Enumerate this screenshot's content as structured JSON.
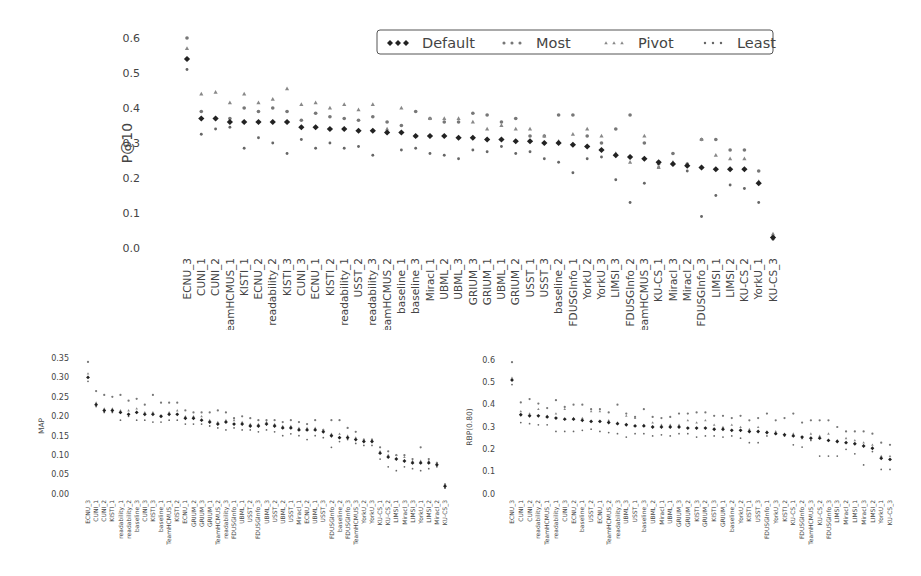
{
  "chart_data": [
    {
      "type": "scatter",
      "title": "",
      "xlabel": "",
      "ylabel": "P@10",
      "ylim": [
        0.0,
        0.6
      ],
      "yticks": [
        "0.0",
        "0.1",
        "0.2",
        "0.3",
        "0.4",
        "0.5",
        "0.6"
      ],
      "grid": false,
      "legend": {
        "position": "upper right",
        "entries": [
          "Default",
          "Most",
          "Pivot",
          "Least"
        ],
        "orientation": "horizontal"
      },
      "categories": [
        "ECNU_3",
        "CUNI_1",
        "CUNI_2",
        "TeamHCMUS_1",
        "KISTI_1",
        "ECNU_2",
        "readability_2",
        "KISTI_3",
        "CUNI_3",
        "ECNU_1",
        "KISTI_2",
        "readability_1",
        "USST_2",
        "readability_3",
        "TeamHCMUS_2",
        "baseline_1",
        "baseline_3",
        "Miracl_1",
        "UBML_2",
        "UBML_3",
        "GRIUM_3",
        "GRIUM_1",
        "UBML_1",
        "GRIUM_2",
        "USST_1",
        "USST_3",
        "baseline_2",
        "FDUSGInfo_1",
        "YorkU_2",
        "YorkU_3",
        "LIMSI_3",
        "FDUSGInfo_2",
        "TeamHCMUS_3",
        "KU-CS_1",
        "Miracl_3",
        "Miracl_2",
        "FDUSGInfo_3",
        "LIMSI_1",
        "LIMSI_2",
        "KU-CS_2",
        "YorkU_1",
        "KU-CS_3"
      ],
      "series": [
        {
          "name": "Default",
          "marker": "diamond",
          "values": [
            0.54,
            0.37,
            0.37,
            0.36,
            0.36,
            0.36,
            0.36,
            0.36,
            0.345,
            0.345,
            0.34,
            0.34,
            0.335,
            0.335,
            0.33,
            0.33,
            0.32,
            0.32,
            0.32,
            0.315,
            0.315,
            0.31,
            0.31,
            0.305,
            0.305,
            0.3,
            0.3,
            0.295,
            0.29,
            0.28,
            0.265,
            0.26,
            0.255,
            0.245,
            0.24,
            0.235,
            0.23,
            0.225,
            0.225,
            0.225,
            0.185,
            0.03
          ]
        },
        {
          "name": "Most",
          "marker": "circle",
          "values": [
            0.6,
            0.39,
            0.37,
            0.37,
            0.4,
            0.39,
            0.4,
            0.39,
            0.365,
            0.385,
            0.375,
            0.37,
            0.365,
            0.375,
            0.36,
            0.35,
            0.39,
            0.37,
            0.36,
            0.36,
            0.385,
            0.38,
            0.36,
            0.37,
            0.32,
            0.32,
            0.38,
            0.38,
            0.32,
            0.3,
            0.34,
            0.38,
            0.3,
            0.24,
            0.27,
            0.24,
            0.31,
            0.31,
            0.28,
            0.28,
            0.22,
            0.03
          ]
        },
        {
          "name": "Pivot",
          "marker": "triangle",
          "values": [
            0.57,
            0.44,
            0.445,
            0.415,
            0.44,
            0.415,
            0.425,
            0.455,
            0.41,
            0.415,
            0.4,
            0.41,
            0.395,
            0.41,
            0.34,
            0.4,
            0.32,
            0.37,
            0.37,
            0.37,
            0.36,
            0.34,
            0.35,
            0.34,
            0.34,
            0.32,
            0.305,
            0.325,
            0.34,
            0.32,
            0.27,
            0.245,
            0.32,
            0.23,
            0.245,
            0.24,
            0.31,
            0.265,
            0.255,
            0.255,
            0.19,
            0.04
          ]
        },
        {
          "name": "Least",
          "marker": "dot",
          "values": [
            0.51,
            0.325,
            0.34,
            0.345,
            0.285,
            0.315,
            0.3,
            0.27,
            0.31,
            0.285,
            0.3,
            0.285,
            0.29,
            0.265,
            0.33,
            0.28,
            0.285,
            0.27,
            0.265,
            0.255,
            0.28,
            0.275,
            0.29,
            0.27,
            0.275,
            0.255,
            0.245,
            0.215,
            0.255,
            0.26,
            0.195,
            0.13,
            0.185,
            0.23,
            0.24,
            0.22,
            0.09,
            0.15,
            0.18,
            0.17,
            0.13,
            0.025
          ]
        }
      ]
    },
    {
      "type": "scatter",
      "title": "",
      "xlabel": "",
      "ylabel": "MAP",
      "ylim": [
        0.0,
        0.35
      ],
      "yticks": [
        "0.00",
        "0.05",
        "0.10",
        "0.15",
        "0.20",
        "0.25",
        "0.30",
        "0.35"
      ],
      "grid": false,
      "categories": [
        "ECNU_3",
        "CUNI_1",
        "CUNI_2",
        "KISTI_1",
        "readability_1",
        "readability_2",
        "baseline_3",
        "CUNI_3",
        "KISTI_3",
        "baseline_1",
        "TeamHCMUS_1",
        "KISTI_2",
        "ECNU_1",
        "GRIUM_2",
        "GRIUM_3",
        "GRIUM_1",
        "TeamHCMUS_2",
        "readability_3",
        "FDUSGInfo_1",
        "UBML_1",
        "USST_2",
        "FDUSGInfo_3",
        "UBML_3",
        "USST_2",
        "UBML_2",
        "USST_1",
        "Miracl_1",
        "ECNU_2",
        "UBML_1",
        "USST_3",
        "FDUSGInfo_2",
        "baseline_2",
        "FDUSGInfo_3",
        "TeamHCMUS_3",
        "YorkU_2",
        "YorkU_3",
        "KU-CS_1",
        "KU-CS_2",
        "LIMSI_1",
        "Miracl_3",
        "LIMSI_3",
        "YorkU_1",
        "LIMSI_2",
        "Miracl_2",
        "KU-CS_3"
      ],
      "series": [
        {
          "name": "Default",
          "values": [
            0.3,
            0.23,
            0.215,
            0.215,
            0.21,
            0.205,
            0.21,
            0.205,
            0.205,
            0.2,
            0.205,
            0.205,
            0.195,
            0.195,
            0.19,
            0.185,
            0.18,
            0.185,
            0.18,
            0.18,
            0.175,
            0.175,
            0.18,
            0.175,
            0.17,
            0.17,
            0.165,
            0.165,
            0.165,
            0.16,
            0.15,
            0.145,
            0.145,
            0.14,
            0.135,
            0.135,
            0.105,
            0.095,
            0.09,
            0.085,
            0.08,
            0.08,
            0.08,
            0.075,
            0.02
          ]
        },
        {
          "name": "Most",
          "values": [
            0.34,
            0.265,
            0.255,
            0.25,
            0.255,
            0.24,
            0.245,
            0.23,
            0.255,
            0.235,
            0.235,
            0.235,
            0.215,
            0.21,
            0.21,
            0.21,
            0.215,
            0.21,
            0.195,
            0.2,
            0.195,
            0.19,
            0.19,
            0.19,
            0.185,
            0.19,
            0.185,
            0.18,
            0.19,
            0.165,
            0.19,
            0.19,
            0.17,
            0.16,
            0.14,
            0.14,
            0.12,
            0.11,
            0.1,
            0.1,
            0.09,
            0.12,
            0.09,
            0.08,
            0.025
          ]
        },
        {
          "name": "Pivot",
          "values": [
            0.31,
            0.235,
            0.22,
            0.22,
            0.215,
            0.215,
            0.22,
            0.21,
            0.21,
            0.2,
            0.21,
            0.215,
            0.2,
            0.2,
            0.2,
            0.19,
            0.185,
            0.19,
            0.19,
            0.185,
            0.18,
            0.18,
            0.185,
            0.18,
            0.175,
            0.175,
            0.17,
            0.17,
            0.17,
            0.165,
            0.155,
            0.155,
            0.15,
            0.145,
            0.14,
            0.14,
            0.11,
            0.1,
            0.1,
            0.095,
            0.085,
            0.085,
            0.085,
            0.08,
            0.025
          ]
        },
        {
          "name": "Least",
          "values": [
            0.29,
            0.225,
            0.21,
            0.21,
            0.19,
            0.2,
            0.19,
            0.19,
            0.185,
            0.185,
            0.19,
            0.19,
            0.18,
            0.18,
            0.18,
            0.175,
            0.17,
            0.165,
            0.17,
            0.165,
            0.165,
            0.16,
            0.165,
            0.16,
            0.15,
            0.155,
            0.15,
            0.14,
            0.15,
            0.145,
            0.12,
            0.135,
            0.14,
            0.13,
            0.125,
            0.125,
            0.09,
            0.07,
            0.06,
            0.07,
            0.065,
            0.06,
            0.065,
            0.07,
            0.015
          ]
        }
      ]
    },
    {
      "type": "scatter",
      "title": "",
      "xlabel": "",
      "ylabel": "RBP(0.80)",
      "ylim": [
        0.0,
        0.6
      ],
      "yticks": [
        "0.0",
        "0.1",
        "0.2",
        "0.3",
        "0.4",
        "0.5",
        "0.6"
      ],
      "grid": false,
      "categories": [
        "ECNU_3",
        "CUNI_1",
        "CUNI_2",
        "readability_2",
        "TeamHCMUS_1",
        "readability_1",
        "CUNI_3",
        "ECNU_2",
        "baseline_1",
        "USST_2",
        "ECNU_1",
        "TeamHCMUS_2",
        "readability_3",
        "UBML_3",
        "USST_1",
        "baseline_3",
        "UBML_2",
        "Miracl_1",
        "UBML_1",
        "GRIUM_3",
        "GRIUM_2",
        "KISTI_3",
        "GRIUM_2",
        "KISTI_3",
        "GRIUM_1",
        "baseline_2",
        "YorkU_2",
        "KISTI_1",
        "USST_3",
        "FDUSGInfo_1",
        "YorkU_3",
        "KISTI_2",
        "KU-CS_1",
        "FDUSGInfo_2",
        "TeamHCMUS_3",
        "KU-CS_2",
        "FDUSGInfo_3",
        "LIMSI_3",
        "Miracl_2",
        "LIMSI_1",
        "Miracl_3",
        "LIMSI_2",
        "YorkU_1",
        "KU-CS_3"
      ],
      "series": [
        {
          "name": "Default",
          "values": [
            0.51,
            0.355,
            0.35,
            0.35,
            0.345,
            0.34,
            0.335,
            0.335,
            0.33,
            0.325,
            0.325,
            0.32,
            0.315,
            0.31,
            0.305,
            0.305,
            0.3,
            0.3,
            0.3,
            0.3,
            0.295,
            0.295,
            0.295,
            0.29,
            0.29,
            0.285,
            0.285,
            0.28,
            0.28,
            0.275,
            0.27,
            0.265,
            0.26,
            0.255,
            0.25,
            0.25,
            0.24,
            0.235,
            0.23,
            0.225,
            0.215,
            0.205,
            0.16,
            0.155
          ]
        },
        {
          "name": "Most",
          "values": [
            0.59,
            0.41,
            0.425,
            0.405,
            0.385,
            0.42,
            0.39,
            0.4,
            0.4,
            0.38,
            0.38,
            0.365,
            0.4,
            0.36,
            0.345,
            0.38,
            0.345,
            0.34,
            0.345,
            0.36,
            0.36,
            0.365,
            0.365,
            0.35,
            0.35,
            0.34,
            0.35,
            0.33,
            0.34,
            0.36,
            0.33,
            0.34,
            0.36,
            0.32,
            0.33,
            0.33,
            0.33,
            0.3,
            0.28,
            0.28,
            0.28,
            0.27,
            0.23,
            0.22
          ]
        },
        {
          "name": "Pivot",
          "values": [
            0.52,
            0.37,
            0.36,
            0.38,
            0.35,
            0.36,
            0.38,
            0.34,
            0.34,
            0.37,
            0.37,
            0.33,
            0.32,
            0.35,
            0.34,
            0.31,
            0.32,
            0.31,
            0.31,
            0.31,
            0.33,
            0.32,
            0.33,
            0.31,
            0.3,
            0.31,
            0.3,
            0.29,
            0.3,
            0.28,
            0.28,
            0.27,
            0.27,
            0.25,
            0.27,
            0.26,
            0.27,
            0.24,
            0.25,
            0.24,
            0.23,
            0.22,
            0.17,
            0.17
          ]
        },
        {
          "name": "Least",
          "values": [
            0.49,
            0.32,
            0.315,
            0.31,
            0.31,
            0.28,
            0.28,
            0.28,
            0.285,
            0.29,
            0.28,
            0.275,
            0.27,
            0.255,
            0.27,
            0.27,
            0.26,
            0.265,
            0.26,
            0.27,
            0.27,
            0.255,
            0.26,
            0.26,
            0.255,
            0.26,
            0.25,
            0.23,
            0.23,
            0.26,
            0.27,
            0.26,
            0.22,
            0.21,
            0.24,
            0.17,
            0.17,
            0.17,
            0.2,
            0.18,
            0.13,
            0.19,
            0.11,
            0.11
          ]
        }
      ]
    }
  ],
  "legend": {
    "entries": [
      {
        "label": "Default",
        "marker": "diamond"
      },
      {
        "label": "Most",
        "marker": "circle"
      },
      {
        "label": "Pivot",
        "marker": "triangle"
      },
      {
        "label": "Least",
        "marker": "dot"
      }
    ]
  },
  "colors": {
    "default": "#222222",
    "most": "#777777",
    "pivot": "#888888",
    "least": "#666666",
    "axis_text": "#444444",
    "legend_border": "#555555"
  }
}
